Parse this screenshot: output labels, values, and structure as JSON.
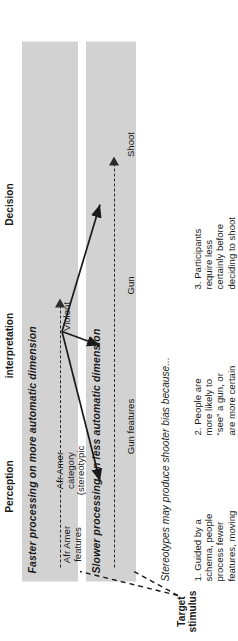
{
  "figure": {
    "target": {
      "label": "Target\nstimulus"
    },
    "bands": {
      "automatic": {
        "title": "Faster processing on more automatic dimension",
        "nodes": {
          "features": "Afr Amer\nfeatures",
          "category": "Afr Amer\ncategory\n(stereotypic\nassociation)",
          "outcome": "Violent"
        }
      },
      "controlled": {
        "title": "Slower processing on less automatic dimension",
        "headers": {
          "perception": "Perception",
          "interpretation": "interpretation",
          "decision": "Decision"
        },
        "nodes": {
          "perception": "Gun features",
          "interpretation": "Gun",
          "decision": "Shoot"
        }
      }
    },
    "caption": "Stereotypes may produce shooter bias because...",
    "notes": [
      "1. Guided by a\nschema, people\nprocess fewer\nfeatures, moving\nmore quickly to\ninterpretation",
      "2. People are\nmore likely to\n“see” a gun, or\nare more certain\nof the gun\ninterpretation",
      "3. Participants\nrequire less\ncertainly before\ndeciding to shoot"
    ],
    "colors": {
      "band_fill": "#d2d2d2",
      "ink": "#1a1a1a",
      "page": "#ffffff"
    }
  }
}
